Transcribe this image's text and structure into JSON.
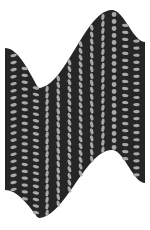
{
  "graphic": {
    "description": "Warped wave band with dot pattern",
    "width": 150,
    "height": 230,
    "colors": {
      "background": "#ffffff",
      "band": "#262626",
      "dots": "#a9a9a9"
    },
    "band": {
      "x_start": 5,
      "x_end": 145,
      "top_edge": [
        [
          5,
          48
        ],
        [
          38,
          88
        ],
        [
          112,
          10
        ],
        [
          145,
          42
        ]
      ],
      "bottom_edge": [
        [
          5,
          190
        ],
        [
          38,
          218
        ],
        [
          112,
          150
        ],
        [
          145,
          183
        ]
      ]
    },
    "dots": {
      "columns": 12,
      "rows": 20,
      "round_column_positions": [
        38,
        112
      ]
    }
  }
}
